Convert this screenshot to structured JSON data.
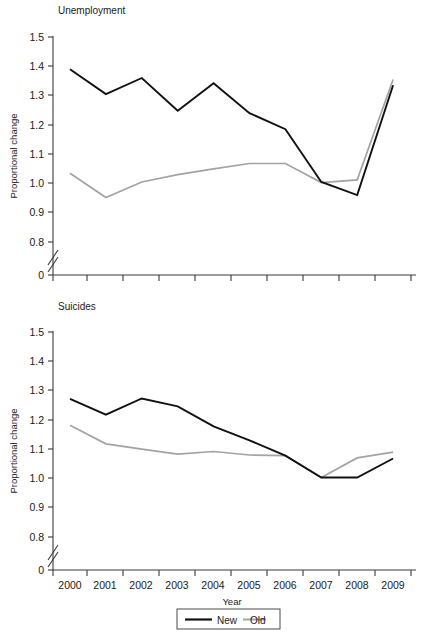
{
  "figure": {
    "background": "#ffffff",
    "width": 433,
    "height": 634
  },
  "colors": {
    "new_series": "#111111",
    "old_series": "#a3a3a3",
    "axis": "#3a3a3a",
    "text": "#1a1a1a"
  },
  "axis_labels": {
    "y_title": "Proportional change",
    "x_title": "Year",
    "y_ticks": [
      "0",
      "0.8",
      "0.9",
      "1.0",
      "1.1",
      "1.2",
      "1.3",
      "1.4",
      "1.5"
    ],
    "x_ticks": [
      "2000",
      "2001",
      "2002",
      "2003",
      "2004",
      "2005",
      "2006",
      "2007",
      "2008",
      "2009"
    ]
  },
  "legend": {
    "entries": [
      {
        "label": "New",
        "color": "#111111"
      },
      {
        "label": "Old",
        "color": "#a3a3a3"
      }
    ]
  },
  "panels": {
    "top": {
      "title": "Unemployment"
    },
    "bottom": {
      "title": "Suicides"
    }
  },
  "chart_data": [
    {
      "type": "line",
      "title": "Unemployment",
      "xlabel": "Year",
      "ylabel": "Proportional change",
      "x": [
        2000,
        2001,
        2002,
        2003,
        2004,
        2005,
        2006,
        2007,
        2008,
        2009
      ],
      "categories": [
        "2000",
        "2001",
        "2002",
        "2003",
        "2004",
        "2005",
        "2006",
        "2007",
        "2008",
        "2009"
      ],
      "series": [
        {
          "name": "New",
          "color": "#111111",
          "values": [
            1.39,
            1.305,
            1.36,
            1.248,
            1.342,
            1.24,
            1.185,
            1.005,
            0.96,
            1.335
          ]
        },
        {
          "name": "Old",
          "color": "#a3a3a3",
          "values": [
            1.035,
            0.952,
            1.005,
            1.03,
            1.05,
            1.068,
            1.068,
            1.003,
            1.012,
            1.355
          ]
        }
      ],
      "ylim": [
        0.75,
        1.5
      ],
      "yticks": [
        0.8,
        0.9,
        1.0,
        1.1,
        1.2,
        1.3,
        1.4,
        1.5
      ],
      "y_axis_break": true,
      "y_axis_break_from": 0,
      "grid": false,
      "legend_position": "below-figure"
    },
    {
      "type": "line",
      "title": "Suicides",
      "xlabel": "Year",
      "ylabel": "Proportional change",
      "x": [
        2000,
        2001,
        2002,
        2003,
        2004,
        2005,
        2006,
        2007,
        2008,
        2009
      ],
      "categories": [
        "2000",
        "2001",
        "2002",
        "2003",
        "2004",
        "2005",
        "2006",
        "2007",
        "2008",
        "2009"
      ],
      "series": [
        {
          "name": "New",
          "color": "#111111",
          "values": [
            1.272,
            1.218,
            1.273,
            1.246,
            1.178,
            1.13,
            1.078,
            1.003,
            1.003,
            1.068
          ]
        },
        {
          "name": "Old",
          "color": "#a3a3a3",
          "values": [
            1.182,
            1.118,
            1.1,
            1.083,
            1.092,
            1.08,
            1.078,
            1.003,
            1.07,
            1.09
          ]
        }
      ],
      "ylim": [
        0.75,
        1.5
      ],
      "yticks": [
        0.8,
        0.9,
        1.0,
        1.1,
        1.2,
        1.3,
        1.4,
        1.5
      ],
      "y_axis_break": true,
      "y_axis_break_from": 0,
      "grid": false,
      "legend_position": "below-figure"
    }
  ]
}
